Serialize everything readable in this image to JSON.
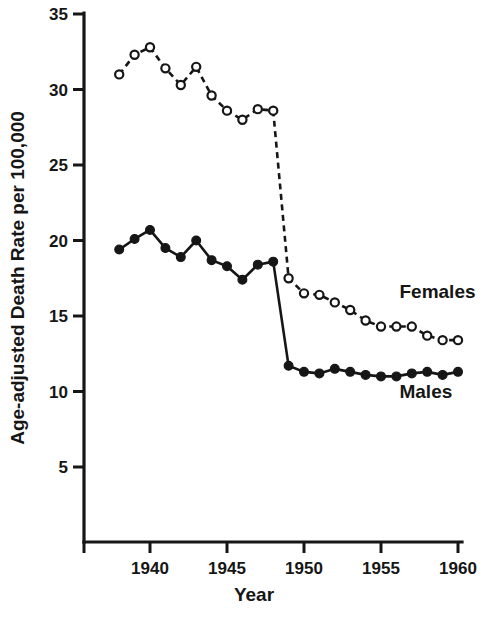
{
  "chart_data": {
    "type": "line",
    "title": "",
    "xlabel": "Year",
    "ylabel": "Age-adjusted Death Rate per 100,000",
    "xlim": [
      1937,
      1960.6
    ],
    "ylim": [
      0,
      35
    ],
    "grid": false,
    "legend_position": "inline-right",
    "xticks": [
      1940,
      1945,
      1950,
      1955,
      1960
    ],
    "xtick_labels": [
      "1940",
      "1945",
      "1950",
      "1955",
      "1960"
    ],
    "yticks": [
      5,
      10,
      15,
      20,
      25,
      30,
      35
    ],
    "ytick_labels": [
      "5",
      "10",
      "15",
      "20",
      "25",
      "30",
      "35"
    ],
    "x": [
      1938,
      1939,
      1940,
      1941,
      1942,
      1943,
      1944,
      1945,
      1946,
      1947,
      1948,
      1949,
      1950,
      1951,
      1952,
      1953,
      1954,
      1955,
      1956,
      1957,
      1958,
      1959,
      1960
    ],
    "series": [
      {
        "name": "Females",
        "marker": "open-circle",
        "linestyle": "dashed",
        "label": "Females",
        "values": [
          31.0,
          32.3,
          32.8,
          31.4,
          30.3,
          31.5,
          29.6,
          28.6,
          28.0,
          28.7,
          28.6,
          17.5,
          16.5,
          16.4,
          15.9,
          15.4,
          14.7,
          14.3,
          14.3,
          14.3,
          13.7,
          13.4,
          13.4
        ]
      },
      {
        "name": "Males",
        "marker": "filled-circle",
        "linestyle": "solid",
        "label": "Males",
        "values": [
          19.4,
          20.1,
          20.7,
          19.5,
          18.9,
          20.0,
          18.7,
          18.3,
          17.4,
          18.4,
          18.6,
          11.7,
          11.3,
          11.2,
          11.5,
          11.3,
          11.1,
          11.0,
          11.0,
          11.2,
          11.3,
          11.1,
          11.3
        ]
      }
    ],
    "annotations": [
      {
        "text": "Females",
        "x": 1956.2,
        "y": 16.2
      },
      {
        "text": "Males",
        "x": 1956.2,
        "y": 9.6
      }
    ]
  },
  "axes": {
    "x_title": "Year",
    "y_title": "Age-adjusted Death Rate per 100,000"
  }
}
